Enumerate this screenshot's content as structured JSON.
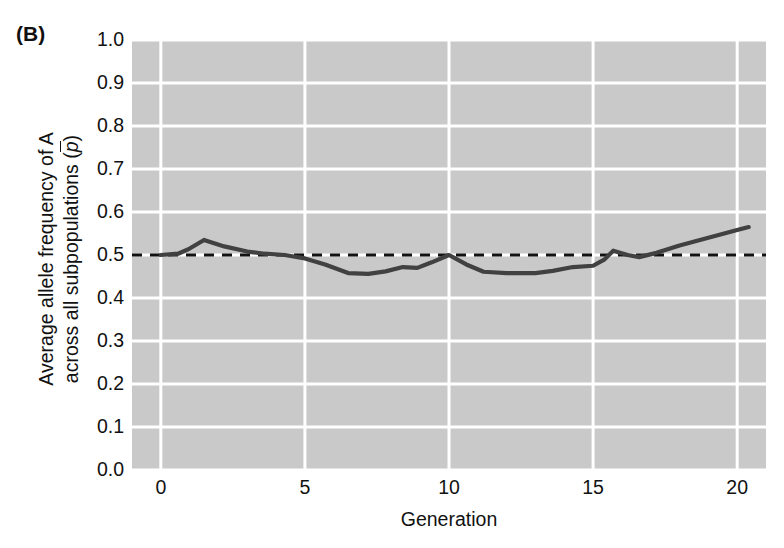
{
  "figure": {
    "panel_label": "(B)",
    "background_color": "#ffffff",
    "plot_background_color": "#c9c9c9",
    "gridline_color": "#ffffff",
    "data_line_color": "#414141",
    "reference_line_color": "#111111"
  },
  "chart_data": {
    "type": "line",
    "title": "",
    "panel": "(B)",
    "xlabel": "Generation",
    "ylabel_line1": "Average allele frequency of A",
    "ylabel_line2": "across all subpopulations (p̄)",
    "ylabel": "Average allele frequency of A across all subpopulations (p̄)",
    "xlim": [
      -1.0,
      21.0
    ],
    "ylim": [
      0.0,
      1.0
    ],
    "xticks": [
      0,
      5,
      10,
      15,
      20
    ],
    "xticklabels": [
      "0",
      "5",
      "10",
      "15",
      "20"
    ],
    "yticks": [
      0.0,
      0.1,
      0.2,
      0.3,
      0.4,
      0.5,
      0.6,
      0.7,
      0.8,
      0.9,
      1.0
    ],
    "yticklabels": [
      "0.0",
      "0.1",
      "0.2",
      "0.3",
      "0.4",
      "0.5",
      "0.6",
      "0.7",
      "0.8",
      "0.9",
      "1.0"
    ],
    "grid": true,
    "grid_axis": "both",
    "legend": false,
    "reference_line": {
      "name": "initial-allele-frequency",
      "orientation": "horizontal",
      "y": 0.5,
      "style": "dashed",
      "x_start": -1.0,
      "x_end": 21.0
    },
    "series": [
      {
        "name": "Average allele frequency (p-bar)",
        "style": "solid",
        "x": [
          0.0,
          0.6,
          1.0,
          1.5,
          2.2,
          3.0,
          3.6,
          4.3,
          5.0,
          5.7,
          6.5,
          7.2,
          7.8,
          8.4,
          8.9,
          9.4,
          10.0,
          10.6,
          11.2,
          12.0,
          13.0,
          13.6,
          14.3,
          15.0,
          15.4,
          15.7,
          16.2,
          16.6,
          17.2,
          18.0,
          19.0,
          20.0,
          20.4
        ],
        "y": [
          0.5,
          0.503,
          0.515,
          0.535,
          0.52,
          0.508,
          0.503,
          0.5,
          0.492,
          0.478,
          0.458,
          0.456,
          0.462,
          0.472,
          0.47,
          0.483,
          0.5,
          0.478,
          0.461,
          0.458,
          0.458,
          0.463,
          0.472,
          0.475,
          0.49,
          0.51,
          0.5,
          0.495,
          0.505,
          0.522,
          0.54,
          0.558,
          0.565
        ]
      }
    ]
  }
}
